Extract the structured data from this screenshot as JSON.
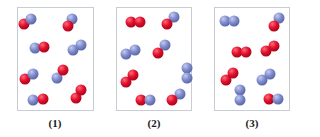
{
  "colors": {
    "red_atom": "#e0102c",
    "blue_atom": "#7f8ccc",
    "panel_border": "#c8ccd4"
  },
  "panels": [
    {
      "label": "(1)",
      "box": {
        "x": 17,
        "y": 7,
        "w": 77,
        "h": 104
      },
      "label_x": 55,
      "molecules": [
        {
          "atoms": [
            {
              "c": "red",
              "x": 24,
              "y": 24
            },
            {
              "c": "blue",
              "x": 31,
              "y": 19
            }
          ]
        },
        {
          "atoms": [
            {
              "c": "blue",
              "x": 72,
              "y": 19
            },
            {
              "c": "red",
              "x": 68,
              "y": 26
            }
          ]
        },
        {
          "atoms": [
            {
              "c": "blue",
              "x": 35,
              "y": 48
            },
            {
              "c": "red",
              "x": 44,
              "y": 47
            }
          ]
        },
        {
          "atoms": [
            {
              "c": "blue",
              "x": 73,
              "y": 50
            },
            {
              "c": "blue",
              "x": 81,
              "y": 45
            }
          ]
        },
        {
          "atoms": [
            {
              "c": "red",
              "x": 25,
              "y": 79
            },
            {
              "c": "blue",
              "x": 33,
              "y": 74
            }
          ]
        },
        {
          "atoms": [
            {
              "c": "blue",
              "x": 57,
              "y": 78
            },
            {
              "c": "red",
              "x": 63,
              "y": 70
            }
          ]
        },
        {
          "atoms": [
            {
              "c": "red",
              "x": 76,
              "y": 98
            },
            {
              "c": "red",
              "x": 81,
              "y": 90
            }
          ]
        },
        {
          "atoms": [
            {
              "c": "blue",
              "x": 33,
              "y": 100
            },
            {
              "c": "red",
              "x": 43,
              "y": 99
            }
          ]
        }
      ]
    },
    {
      "label": "(2)",
      "box": {
        "x": 116,
        "y": 7,
        "w": 76,
        "h": 104
      },
      "label_x": 154,
      "molecules": [
        {
          "atoms": [
            {
              "c": "red",
              "x": 131,
              "y": 22
            },
            {
              "c": "red",
              "x": 140,
              "y": 22
            }
          ]
        },
        {
          "atoms": [
            {
              "c": "blue",
              "x": 174,
              "y": 17
            },
            {
              "c": "red",
              "x": 167,
              "y": 24
            }
          ]
        },
        {
          "atoms": [
            {
              "c": "blue",
              "x": 126,
              "y": 54
            },
            {
              "c": "blue",
              "x": 135,
              "y": 50
            }
          ]
        },
        {
          "atoms": [
            {
              "c": "blue",
              "x": 165,
              "y": 45
            },
            {
              "c": "red",
              "x": 158,
              "y": 53
            }
          ]
        },
        {
          "atoms": [
            {
              "c": "blue",
              "x": 187,
              "y": 68
            },
            {
              "c": "blue",
              "x": 187,
              "y": 78
            }
          ]
        },
        {
          "atoms": [
            {
              "c": "red",
              "x": 126,
              "y": 82
            },
            {
              "c": "red",
              "x": 133,
              "y": 75
            }
          ]
        },
        {
          "atoms": [
            {
              "c": "red",
              "x": 141,
              "y": 100
            },
            {
              "c": "blue",
              "x": 150,
              "y": 100
            }
          ]
        },
        {
          "atoms": [
            {
              "c": "blue",
              "x": 180,
              "y": 94
            },
            {
              "c": "red",
              "x": 172,
              "y": 100
            }
          ]
        }
      ]
    },
    {
      "label": "(3)",
      "box": {
        "x": 214,
        "y": 7,
        "w": 76,
        "h": 104
      },
      "label_x": 252,
      "molecules": [
        {
          "atoms": [
            {
              "c": "blue",
              "x": 225,
              "y": 21
            },
            {
              "c": "blue",
              "x": 234,
              "y": 21
            }
          ]
        },
        {
          "atoms": [
            {
              "c": "blue",
              "x": 279,
              "y": 18
            },
            {
              "c": "red",
              "x": 274,
              "y": 26
            }
          ]
        },
        {
          "atoms": [
            {
              "c": "red",
              "x": 237,
              "y": 52
            },
            {
              "c": "red",
              "x": 246,
              "y": 52
            }
          ]
        },
        {
          "atoms": [
            {
              "c": "red",
              "x": 266,
              "y": 51
            },
            {
              "c": "red",
              "x": 274,
              "y": 46
            }
          ]
        },
        {
          "atoms": [
            {
              "c": "red",
              "x": 226,
              "y": 80
            },
            {
              "c": "red",
              "x": 233,
              "y": 73
            }
          ]
        },
        {
          "atoms": [
            {
              "c": "blue",
              "x": 262,
              "y": 80
            },
            {
              "c": "blue",
              "x": 270,
              "y": 74
            }
          ]
        },
        {
          "atoms": [
            {
              "c": "blue",
              "x": 240,
              "y": 90
            },
            {
              "c": "blue",
              "x": 240,
              "y": 100
            }
          ]
        },
        {
          "atoms": [
            {
              "c": "red",
              "x": 269,
              "y": 99
            },
            {
              "c": "blue",
              "x": 278,
              "y": 99
            }
          ]
        }
      ]
    }
  ]
}
